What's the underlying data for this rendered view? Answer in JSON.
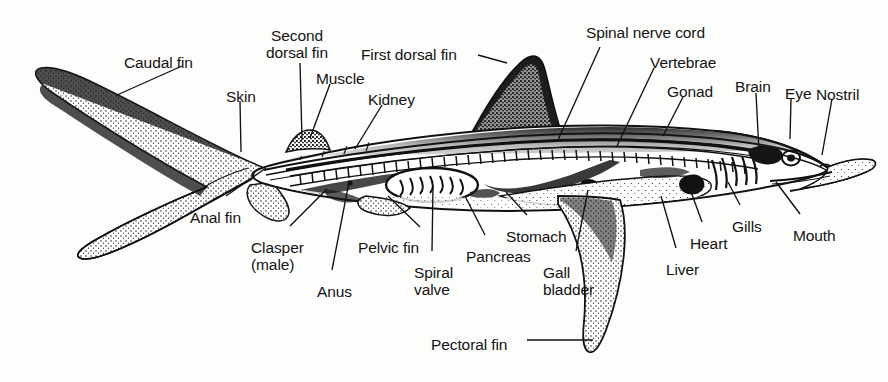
{
  "figure": {
    "background_color": "#fdfdfc",
    "ink_color": "#131313",
    "width": 888,
    "height": 382
  },
  "labels": {
    "caudal_fin": "Caudal fin",
    "second_dorsal_fin": "Second\ndorsal fin",
    "first_dorsal_fin": "First dorsal fin",
    "spinal_nerve_cord": "Spinal nerve cord",
    "vertebrae": "Vertebrae",
    "gonad": "Gonad",
    "brain": "Brain",
    "eye": "Eye",
    "nostril": "Nostril",
    "skin": "Skin",
    "muscle": "Muscle",
    "kidney": "Kidney",
    "anal_fin": "Anal fin",
    "clasper_male": "Clasper\n(male)",
    "anus": "Anus",
    "pelvic_fin": "Pelvic fin",
    "spiral_valve": "Spiral\nvalve",
    "pancreas": "Pancreas",
    "stomach": "Stomach",
    "gall_bladder": "Gall\nbladder",
    "liver": "Liver",
    "heart": "Heart",
    "gills": "Gills",
    "mouth": "Mouth",
    "pectoral_fin": "Pectoral fin"
  },
  "label_layout": [
    {
      "key": "caudal_fin",
      "x": 124,
      "y": 54,
      "align": "left"
    },
    {
      "key": "second_dorsal_fin",
      "x": 297,
      "y": 27,
      "align": "center"
    },
    {
      "key": "first_dorsal_fin",
      "x": 361,
      "y": 46,
      "align": "left"
    },
    {
      "key": "spinal_nerve_cord",
      "x": 586,
      "y": 24,
      "align": "left"
    },
    {
      "key": "vertebrae",
      "x": 650,
      "y": 54,
      "align": "left"
    },
    {
      "key": "gonad",
      "x": 667,
      "y": 83,
      "align": "left"
    },
    {
      "key": "brain",
      "x": 735,
      "y": 78,
      "align": "left"
    },
    {
      "key": "eye",
      "x": 785,
      "y": 85,
      "align": "left"
    },
    {
      "key": "nostril",
      "x": 816,
      "y": 86,
      "align": "left"
    },
    {
      "key": "skin",
      "x": 226,
      "y": 88,
      "align": "left"
    },
    {
      "key": "muscle",
      "x": 316,
      "y": 70,
      "align": "left"
    },
    {
      "key": "kidney",
      "x": 368,
      "y": 91,
      "align": "left"
    },
    {
      "key": "anal_fin",
      "x": 190,
      "y": 209,
      "align": "left"
    },
    {
      "key": "clasper_male",
      "x": 251,
      "y": 239,
      "align": "left"
    },
    {
      "key": "anus",
      "x": 317,
      "y": 283,
      "align": "left"
    },
    {
      "key": "pelvic_fin",
      "x": 358,
      "y": 239,
      "align": "left"
    },
    {
      "key": "spiral_valve",
      "x": 414,
      "y": 264,
      "align": "left"
    },
    {
      "key": "pancreas",
      "x": 466,
      "y": 248,
      "align": "left"
    },
    {
      "key": "stomach",
      "x": 506,
      "y": 228,
      "align": "left"
    },
    {
      "key": "gall_bladder",
      "x": 543,
      "y": 264,
      "align": "left"
    },
    {
      "key": "liver",
      "x": 666,
      "y": 261,
      "align": "left"
    },
    {
      "key": "heart",
      "x": 690,
      "y": 235,
      "align": "left"
    },
    {
      "key": "gills",
      "x": 732,
      "y": 218,
      "align": "left"
    },
    {
      "key": "mouth",
      "x": 793,
      "y": 227,
      "align": "left"
    },
    {
      "key": "pectoral_fin",
      "x": 431,
      "y": 336,
      "align": "left"
    }
  ],
  "leader_lines": [
    {
      "key": "caudal_fin",
      "x1": 182,
      "y1": 66,
      "x2": 117,
      "y2": 95
    },
    {
      "key": "second_dorsal_fin",
      "x1": 300,
      "y1": 63,
      "x2": 302,
      "y2": 140
    },
    {
      "key": "first_dorsal_fin",
      "x1": 478,
      "y1": 55,
      "x2": 507,
      "y2": 63
    },
    {
      "key": "spinal_nerve_cord",
      "x1": 600,
      "y1": 47,
      "x2": 558,
      "y2": 140
    },
    {
      "key": "vertebrae",
      "x1": 654,
      "y1": 68,
      "x2": 617,
      "y2": 146
    },
    {
      "key": "gonad",
      "x1": 683,
      "y1": 97,
      "x2": 663,
      "y2": 136
    },
    {
      "key": "brain",
      "x1": 756,
      "y1": 93,
      "x2": 759,
      "y2": 152
    },
    {
      "key": "eye",
      "x1": 791,
      "y1": 99,
      "x2": 790,
      "y2": 139
    },
    {
      "key": "nostril",
      "x1": 832,
      "y1": 99,
      "x2": 822,
      "y2": 155
    },
    {
      "key": "skin",
      "x1": 240,
      "y1": 101,
      "x2": 241,
      "y2": 152
    },
    {
      "key": "muscle",
      "x1": 330,
      "y1": 84,
      "x2": 310,
      "y2": 138
    },
    {
      "key": "kidney",
      "x1": 382,
      "y1": 105,
      "x2": 355,
      "y2": 149
    },
    {
      "key": "anal_fin",
      "x1": 226,
      "y1": 196,
      "x2": 266,
      "y2": 168
    },
    {
      "key": "clasper_male",
      "x1": 290,
      "y1": 226,
      "x2": 327,
      "y2": 189
    },
    {
      "key": "anus",
      "x1": 332,
      "y1": 270,
      "x2": 349,
      "y2": 182
    },
    {
      "key": "pelvic_fin",
      "x1": 420,
      "y1": 227,
      "x2": 388,
      "y2": 196
    },
    {
      "key": "spiral_valve",
      "x1": 432,
      "y1": 251,
      "x2": 433,
      "y2": 186
    },
    {
      "key": "pancreas",
      "x1": 485,
      "y1": 235,
      "x2": 465,
      "y2": 196
    },
    {
      "key": "stomach",
      "x1": 527,
      "y1": 215,
      "x2": 506,
      "y2": 192
    },
    {
      "key": "gall_bladder",
      "x1": 576,
      "y1": 251,
      "x2": 588,
      "y2": 190
    },
    {
      "key": "liver",
      "x1": 676,
      "y1": 248,
      "x2": 661,
      "y2": 196
    },
    {
      "key": "heart",
      "x1": 702,
      "y1": 222,
      "x2": 690,
      "y2": 189
    },
    {
      "key": "gills",
      "x1": 740,
      "y1": 205,
      "x2": 728,
      "y2": 182
    },
    {
      "key": "mouth",
      "x1": 800,
      "y1": 214,
      "x2": 776,
      "y2": 182
    },
    {
      "key": "pectoral_fin",
      "x1": 527,
      "y1": 340,
      "x2": 593,
      "y2": 340
    }
  ]
}
